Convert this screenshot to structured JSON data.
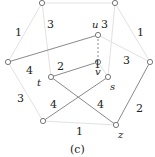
{
  "caption": "(c)",
  "nodes": {
    "top_left": {
      "x": 42,
      "y": 3,
      "label": ""
    },
    "top_right": {
      "x": 115,
      "y": 3,
      "label": ""
    },
    "left": {
      "x": 8,
      "y": 62,
      "label": ""
    },
    "right": {
      "x": 150,
      "y": 62,
      "label": ""
    },
    "u": {
      "x": 98,
      "y": 35,
      "label": "u"
    },
    "v": {
      "x": 98,
      "y": 62,
      "label": "v"
    },
    "t": {
      "x": 51,
      "y": 77,
      "label": "t"
    },
    "s": {
      "x": 108,
      "y": 77,
      "label": "s"
    },
    "bottom_left": {
      "x": 43,
      "y": 121,
      "label": ""
    },
    "z": {
      "x": 116,
      "y": 125,
      "label": "z"
    }
  },
  "edge_labels": {
    "tl_left": "1",
    "tl_t": "3",
    "tr_s": "3",
    "tr_right": "1",
    "left_u": "4",
    "t_v": "2",
    "v_s": "1",
    "u_right": "3",
    "left_bl": "3",
    "bl_s": "4",
    "t_z": "4",
    "bl_z": "1",
    "right_z": "2"
  },
  "colors": {
    "strong_edge": "#8a8a8a",
    "faint_edge": "#e2e2e2",
    "node_stroke": "#777777"
  }
}
